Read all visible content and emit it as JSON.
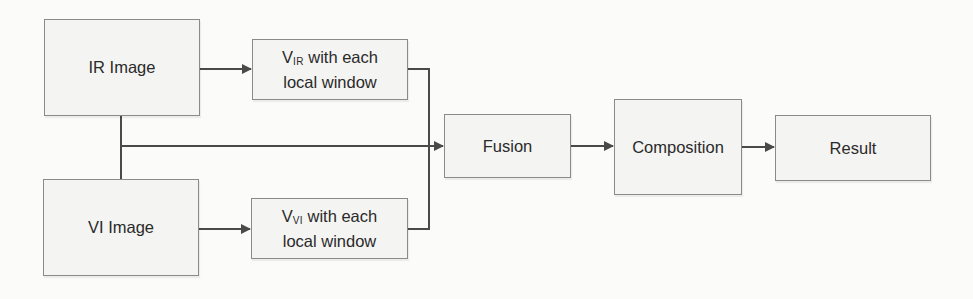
{
  "diagram": {
    "nodes": [
      {
        "id": "ir_image",
        "label": "IR Image"
      },
      {
        "id": "v_ir",
        "prefix": "V",
        "subscript": "IR",
        "line1_rest": " with each",
        "line2": "local window"
      },
      {
        "id": "vi_image",
        "label": "VI Image"
      },
      {
        "id": "v_vi",
        "prefix": "V",
        "subscript": "VI",
        "line1_rest": " with each",
        "line2": "local window"
      },
      {
        "id": "fusion",
        "label": "Fusion"
      },
      {
        "id": "composition",
        "label": "Composition"
      },
      {
        "id": "result",
        "label": "Result"
      }
    ],
    "edges": [
      {
        "from": "ir_image",
        "to": "v_ir"
      },
      {
        "from": "vi_image",
        "to": "v_vi"
      },
      {
        "from": "v_ir",
        "to": "fusion"
      },
      {
        "from": "v_vi",
        "to": "fusion"
      },
      {
        "from": "ir_image",
        "to": "fusion",
        "via": "shared vertical trunk"
      },
      {
        "from": "vi_image",
        "to": "fusion",
        "via": "shared vertical trunk"
      },
      {
        "from": "fusion",
        "to": "composition"
      },
      {
        "from": "composition",
        "to": "result"
      }
    ],
    "colors": {
      "line": "#4a4a4a",
      "box_border": "#8a8a8a",
      "box_fill": "#f4f4f2",
      "background": "#fbfbfa"
    }
  }
}
